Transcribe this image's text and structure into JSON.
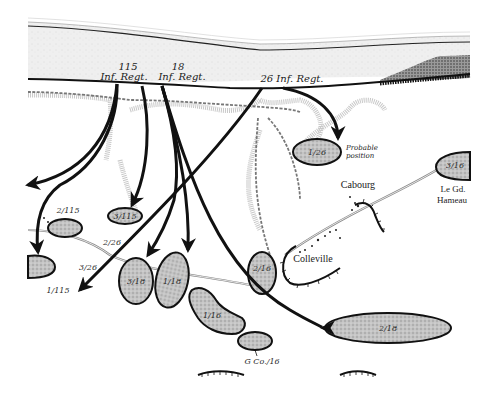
{
  "map": {
    "subject": "Omaha Beach landing sector",
    "colors": {
      "sea": "#ededed",
      "shoreline": "#111111",
      "unit_fill": "#b9b9b9",
      "unit_stroke": "#111111",
      "arrow": "#111111",
      "bluff": "#c8c8c8",
      "road": "#777777",
      "background": "#ffffff"
    },
    "regiments": [
      {
        "id": "115",
        "line1": "115",
        "line2": "Inf. Regt."
      },
      {
        "id": "18",
        "line1": "18",
        "line2": "Inf. Regt."
      },
      {
        "id": "26",
        "label": "26 Inf. Regt."
      }
    ],
    "units": [
      {
        "id": "1/26",
        "label": "1/26",
        "note": "Probable position"
      },
      {
        "id": "3/16",
        "label": "3/16"
      },
      {
        "id": "3/115",
        "label": "3/115"
      },
      {
        "id": "2/115",
        "label": "2/115"
      },
      {
        "id": "1/115",
        "label": "1/115"
      },
      {
        "id": "3/18",
        "label": "3/18"
      },
      {
        "id": "1/18",
        "label": "1/18"
      },
      {
        "id": "2/16",
        "label": "2/16"
      },
      {
        "id": "1/16",
        "label": "1/16"
      },
      {
        "id": "G Co./16",
        "label": "G Co./16"
      },
      {
        "id": "2/18",
        "label": "2/18"
      }
    ],
    "movement_labels": {
      "2/26": "2/26",
      "3/26": "3/26"
    },
    "places": {
      "cabourg": "Cabourg",
      "colleville": "Colleville",
      "le_gd_hameau_1": "Le Gd.",
      "le_gd_hameau_2": "Hameau"
    },
    "annotations": {
      "probable_1": "Probable",
      "probable_2": "position"
    }
  }
}
